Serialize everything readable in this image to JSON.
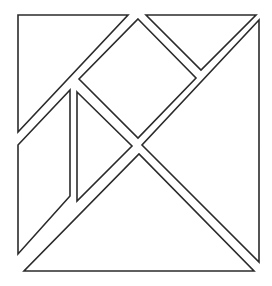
{
  "diagram": {
    "stroke_color": "#2b2b2b",
    "fill_color": "#ffffff",
    "pieces": [
      {
        "name": "large-triangle-top-left",
        "points": "18,15 128,15 18,132"
      },
      {
        "name": "small-triangle-top-right",
        "points": "146,15 256,15 201,70"
      },
      {
        "name": "square-center",
        "points": "138,19 196,78 138,138 79,79"
      },
      {
        "name": "large-triangle-right",
        "points": "259,20 259,262 142,145"
      },
      {
        "name": "large-triangle-bottom",
        "points": "24,271 254,271 139,154"
      },
      {
        "name": "parallelogram-left",
        "points": "18,145 70,90 70,196 18,254"
      },
      {
        "name": "small-triangle-middle",
        "points": "77,92 132,146 77,201"
      }
    ]
  }
}
